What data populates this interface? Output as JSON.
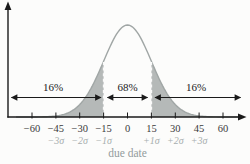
{
  "chart_data": {
    "type": "area",
    "curve": "normal-distribution",
    "title": "",
    "xlabel": "due date",
    "x_tick_values": [
      -60,
      -45,
      -30,
      -15,
      0,
      15,
      30,
      45,
      60
    ],
    "x_tick_labels": [
      "−60",
      "−45",
      "−30",
      "−15",
      "0",
      "15",
      "30",
      "45",
      "60"
    ],
    "sigma_tick_values": [
      -45,
      -30,
      -15,
      15,
      30,
      45
    ],
    "sigma_tick_labels": [
      "−3σ",
      "−2σ",
      "−1σ",
      "+1σ",
      "+2σ",
      "+3σ"
    ],
    "distribution": {
      "mean": 0,
      "sigma": 15
    },
    "boundary_lines_x": [
      -15,
      15
    ],
    "regions": [
      {
        "label": "16%",
        "from_sigma": null,
        "to_sigma": -1,
        "shaded": true
      },
      {
        "label": "68%",
        "from_sigma": -1,
        "to_sigma": 1,
        "shaded": false
      },
      {
        "label": "16%",
        "from_sigma": 1,
        "to_sigma": null,
        "shaded": true
      }
    ],
    "legend": "shaded tails beyond ±1σ, unshaded center between −1σ and +1σ"
  },
  "colors": {
    "shaded_fill": "#b5b9b8",
    "curve_stroke": "#a0a6a5",
    "axis": "#1a1a1a",
    "dashed_boundary": "#fafafa",
    "tick_text": "#3a3a3a",
    "sigma_text": "#a7aeae",
    "xlabel_text": "#939b9b",
    "background": "#fcfcfb"
  }
}
